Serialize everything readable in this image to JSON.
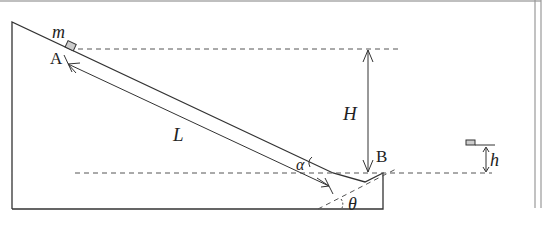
{
  "diagram": {
    "labels": {
      "mass": "m",
      "point_a": "A",
      "point_b": "B",
      "length": "L",
      "height_big": "H",
      "height_small": "h",
      "angle_alpha": "α",
      "angle_theta": "θ"
    },
    "colors": {
      "line": "#333333",
      "dash": "#555555",
      "block_fill": "#cccccc",
      "frame": "#999999"
    }
  }
}
